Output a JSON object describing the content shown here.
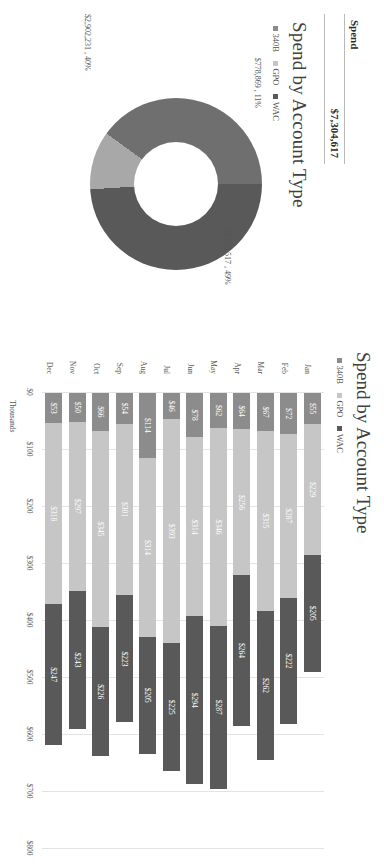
{
  "kpi": {
    "header": "Spend",
    "value": "$7,304,617"
  },
  "donut": {
    "title": "Spend by Account Type",
    "legend": [
      "340B",
      "GPO",
      "WAC"
    ],
    "labels": [
      {
        "value": "$3,623,517",
        "percent": "49%",
        "text": "$3,623,517 , 49%"
      },
      {
        "value": "$778,869",
        "percent": "11%",
        "text": "$778,869 , 11%"
      },
      {
        "value": "$2,902,231",
        "percent": "40%",
        "text": "$2,902,231 , 40%"
      }
    ]
  },
  "bar": {
    "title": "Spend by Account Type",
    "legend": [
      "340B",
      "GPO",
      "WAC"
    ],
    "axis_title": "Thousands"
  },
  "colors": {
    "series_340b": "#8c8c8c",
    "series_gpo": "#c6c6c6",
    "series_wac": "#595959",
    "donut_slice_1": "#595959",
    "donut_slice_2": "#a8a8a8",
    "donut_slice_3": "#6f6f6f",
    "grid": "#e3e3e3",
    "text": "#595959"
  },
  "chart_data": [
    {
      "type": "pie",
      "title": "Spend by Account Type",
      "labels": [
        "340B",
        "GPO",
        "WAC"
      ],
      "values": [
        3623517,
        778869,
        2902231
      ],
      "percents": [
        49,
        11,
        40
      ],
      "display_labels": [
        "$3,623,517 , 49%",
        "$778,869 , 11%",
        "$2,902,231 , 40%"
      ],
      "legend_position": "top",
      "donut": true,
      "total": 7304617
    },
    {
      "type": "bar",
      "title": "Spend by Account Type",
      "orientation": "horizontal-stacked",
      "categories": [
        "Jan",
        "Feb",
        "Mar",
        "Apr",
        "May",
        "Jun",
        "Jul",
        "Aug",
        "Sep",
        "Oct",
        "Nov",
        "Dec"
      ],
      "series": [
        {
          "name": "340B",
          "values": [
            55,
            72,
            67,
            64,
            62,
            78,
            46,
            114,
            54,
            66,
            50,
            53
          ]
        },
        {
          "name": "GPO",
          "values": [
            229,
            287,
            315,
            256,
            346,
            314,
            393,
            314,
            301,
            345,
            297,
            318
          ]
        },
        {
          "name": "WAC",
          "values": [
            205,
            222,
            262,
            264,
            287,
            294,
            225,
            205,
            223,
            226,
            243,
            247
          ]
        }
      ],
      "xlabel": "Thousands",
      "ylabel": "",
      "xlim": [
        0,
        800
      ],
      "xticks": [
        "$0",
        "$100",
        "$200",
        "$300",
        "$400",
        "$500",
        "$600",
        "$700",
        "$800"
      ],
      "grid": true,
      "legend_position": "top",
      "data_labels": true
    }
  ]
}
